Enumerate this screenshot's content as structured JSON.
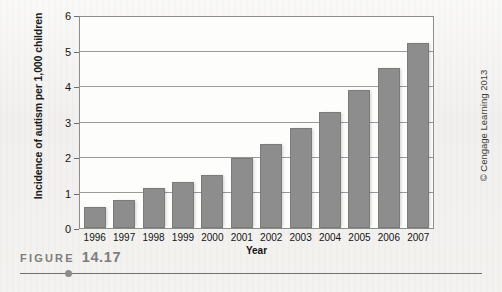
{
  "figure": {
    "caption_word": "FIGURE",
    "caption_number": "14.17",
    "credit": "© Cengage Learning 2013"
  },
  "chart_data": {
    "type": "bar",
    "title": "",
    "xlabel": "Year",
    "ylabel": "Incidence of autism per 1,000 children",
    "categories": [
      "1996",
      "1997",
      "1998",
      "1999",
      "2000",
      "2001",
      "2002",
      "2003",
      "2004",
      "2005",
      "2006",
      "2007"
    ],
    "values": [
      0.6,
      0.8,
      1.15,
      1.3,
      1.5,
      2.0,
      2.4,
      2.85,
      3.3,
      3.92,
      4.55,
      5.25
    ],
    "ylim": [
      0,
      6
    ],
    "yticks": [
      "0",
      "1",
      "2",
      "3",
      "4",
      "5",
      "6"
    ],
    "ytick_values": [
      0,
      1,
      2,
      3,
      4,
      5,
      6
    ],
    "grid": true,
    "legend": "none",
    "bar_color": "#8d8d8d",
    "axis_color": "#8e8e8e"
  }
}
